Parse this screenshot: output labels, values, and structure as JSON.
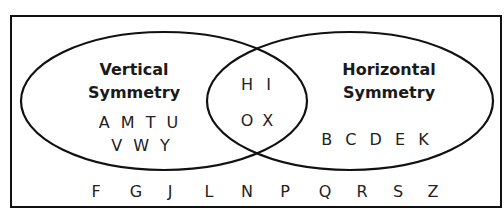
{
  "diagram": {
    "type": "venn",
    "colors": {
      "stroke": "#111111",
      "text": "#222222",
      "background": "#ffffff"
    },
    "sets": [
      {
        "id": "vertical",
        "label_line1": "Vertical",
        "label_line2": "Symmetry",
        "only_members_line1": "A M T U",
        "only_members_line2": "V W Y",
        "only_members": [
          "A",
          "M",
          "T",
          "U",
          "V",
          "W",
          "Y"
        ]
      },
      {
        "id": "horizontal",
        "label_line1": "Horizontal",
        "label_line2": "Symmetry",
        "only_members_line1": "B C D E K",
        "only_members": [
          "B",
          "C",
          "D",
          "E",
          "K"
        ]
      }
    ],
    "intersection": {
      "line1": "H I",
      "line2": "O X",
      "members": [
        "H",
        "I",
        "O",
        "X"
      ]
    },
    "outside": {
      "members": [
        "F",
        "G",
        "J",
        "L",
        "N",
        "P",
        "Q",
        "R",
        "S",
        "Z"
      ]
    }
  }
}
